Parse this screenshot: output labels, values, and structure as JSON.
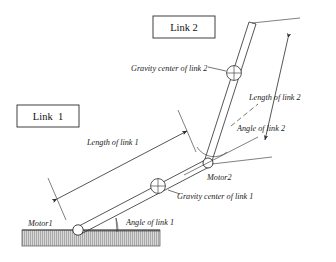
{
  "figure": {
    "background_color": "#ffffff",
    "line_color": "#2b2b2b"
  },
  "boxes": [
    {
      "id": "link2-box",
      "label": "Link 2",
      "x": 153,
      "y": 16,
      "w": 62,
      "h": 22
    },
    {
      "id": "link1-box",
      "label": "Link  1",
      "x": 17,
      "y": 105,
      "w": 62,
      "h": 22
    }
  ],
  "labels": {
    "gravity_center_link2": "Gravity center of link 2",
    "gravity_center_link1": "Gravity center of link 1",
    "length_of_link2": "Length of link 2",
    "length_of_link1": "Length of link 1",
    "angle_of_link2": "Angle of link 2",
    "angle_of_link1": "Angle of link 1",
    "motor1": "Motor1",
    "motor2": "Motor2"
  },
  "joints": [
    {
      "id": "motor1",
      "label": "Motor1",
      "x": 78,
      "y": 230,
      "r": 5.2
    },
    {
      "id": "motor2",
      "label": "Motor2",
      "x": 208,
      "y": 163,
      "r": 5.0
    }
  ],
  "gravity_centers": [
    {
      "id": "gc-link1",
      "x": 158,
      "y": 186,
      "r": 7.4
    },
    {
      "id": "gc-link2",
      "x": 234,
      "y": 73,
      "r": 7.4
    }
  ],
  "links": [
    {
      "id": "link1",
      "from": "motor1",
      "to": "motor2"
    },
    {
      "id": "link2",
      "from": "motor2",
      "to": "tip"
    }
  ],
  "ground": {
    "x": 22,
    "y": 230,
    "w": 138,
    "h": 16,
    "hatch": "vertical"
  },
  "icons": {
    "gravity_center": "crosshair-circle-icon",
    "joint": "pin-joint-icon",
    "arrow": "arrow-head-icon"
  }
}
